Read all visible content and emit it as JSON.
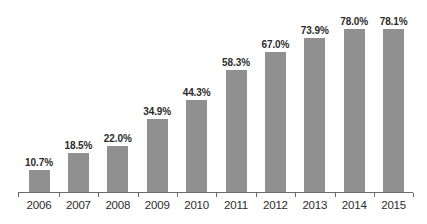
{
  "chart_data": {
    "type": "bar",
    "title": "",
    "subtitle": "",
    "xlabel": "",
    "ylabel": "",
    "categories": [
      "2006",
      "2007",
      "2008",
      "2009",
      "2010",
      "2011",
      "2012",
      "2013",
      "2014",
      "2015"
    ],
    "values": [
      10.7,
      18.5,
      22.0,
      34.9,
      44.3,
      58.3,
      67.0,
      73.9,
      78.0,
      78.1
    ],
    "value_labels": [
      "10.7%",
      "18.5%",
      "22.0%",
      "34.9%",
      "44.3%",
      "58.3%",
      "67.0%",
      "73.9%",
      "78.0%",
      "78.1%"
    ],
    "ylim": [
      0,
      82
    ],
    "grid": false,
    "legend": false,
    "legend_position": "none",
    "annotations": [],
    "bar_color": "#909090",
    "text_color": "#2b2b2b",
    "axis_color": "#6b6b6b",
    "background_color": "#ffffff"
  }
}
